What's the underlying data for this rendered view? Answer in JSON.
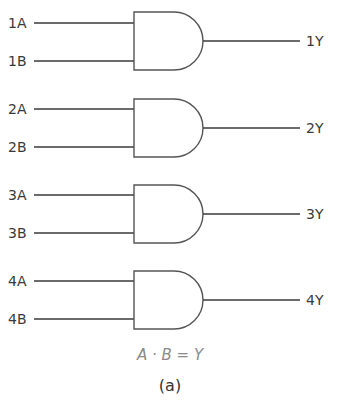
{
  "diagram": {
    "type": "logic-gates",
    "gate_type": "AND",
    "gates": [
      {
        "id": 1,
        "input_a": "1A",
        "input_b": "1B",
        "output": "1Y"
      },
      {
        "id": 2,
        "input_a": "2A",
        "input_b": "2B",
        "output": "2Y"
      },
      {
        "id": 3,
        "input_a": "3A",
        "input_b": "3B",
        "output": "3Y"
      },
      {
        "id": 4,
        "input_a": "4A",
        "input_b": "4B",
        "output": "4Y"
      }
    ],
    "equation": "A · B = Y",
    "caption": "(a)"
  }
}
